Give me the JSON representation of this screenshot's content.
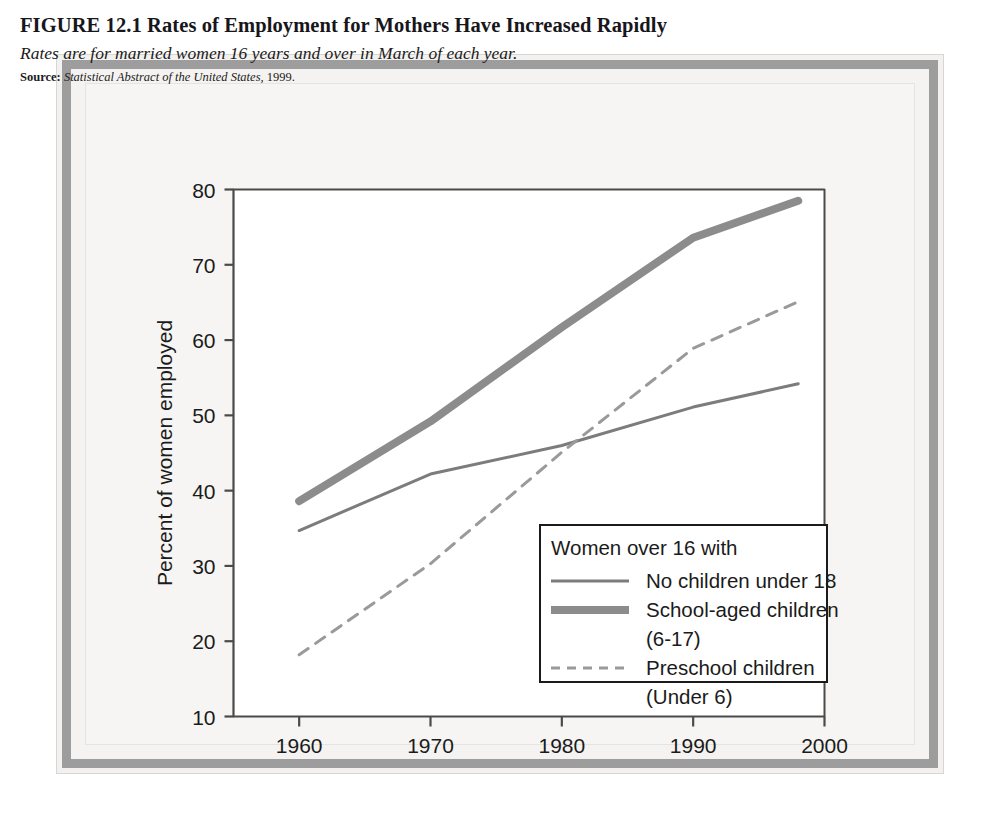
{
  "figure": {
    "title": "FIGURE 12.1  Rates of Employment for Mothers Have Increased Rapidly",
    "subtitle": "Rates are for married women 16 years and over in March of each year.",
    "source_label": "Source:",
    "source_text": "Statistical Abstract of the United States,",
    "source_year": "1999."
  },
  "chart_data": {
    "type": "line",
    "title": "Rates of Employment for Mothers Have Increased Rapidly",
    "subtitle": "Rates are for married women 16 years and over in March of each year.",
    "xlabel": "",
    "ylabel": "Percent of women employed",
    "xlim": [
      1955,
      2000
    ],
    "ylim": [
      10,
      80
    ],
    "xticks": [
      1960,
      1970,
      1980,
      1990,
      2000
    ],
    "xtick_labels": [
      "1960",
      "1970",
      "1980",
      "1990",
      "2000"
    ],
    "yticks": [
      10,
      20,
      30,
      40,
      50,
      60,
      70,
      80
    ],
    "ytick_labels": [
      "10",
      "20",
      "30",
      "40",
      "50",
      "60",
      "70",
      "80"
    ],
    "grid": false,
    "legend_position": "lower right",
    "legend_title": "Women over 16 with",
    "x": [
      1960,
      1970,
      1980,
      1990,
      1998
    ],
    "series": [
      {
        "name": "No children under 18",
        "style": "thin-solid",
        "color": "#7c7c7c",
        "values": [
          34.7,
          42.2,
          46.0,
          51.1,
          54.2
        ]
      },
      {
        "name": "School-aged children (6-17)",
        "style": "thick-solid",
        "color": "#8c8c8c",
        "values": [
          38.6,
          49.2,
          61.7,
          73.6,
          78.5
        ]
      },
      {
        "name": "Preschool children (Under 6)",
        "style": "dashed",
        "color": "#9a9a9a",
        "values": [
          18.2,
          30.3,
          45.1,
          58.9,
          65.1
        ]
      }
    ]
  },
  "legend": {
    "title": "Women over 16 with",
    "entries": [
      {
        "label_line1": "No children under 18",
        "label_line2": "",
        "swatch": "thin-solid-line-icon"
      },
      {
        "label_line1": "School-aged children",
        "label_line2": "(6-17)",
        "swatch": "thick-solid-line-icon"
      },
      {
        "label_line1": "Preschool children",
        "label_line2": "(Under 6)",
        "swatch": "dashed-line-icon"
      }
    ]
  },
  "axes": {
    "y_title": "Percent of women employed",
    "y_ticks": [
      "80",
      "70",
      "60",
      "50",
      "40",
      "30",
      "20",
      "10"
    ],
    "x_ticks": [
      "1960",
      "1970",
      "1980",
      "1990",
      "2000"
    ]
  },
  "colors": {
    "frame_gray": "#9d9d9d",
    "page_bg": "#f6f5f3",
    "plot_bg": "#ffffff",
    "axis_line": "#4a4a4a",
    "series_thin": "#7c7c7c",
    "series_thick": "#8c8c8c",
    "series_dashed": "#9a9a9a",
    "text": "#1b1b1b"
  }
}
